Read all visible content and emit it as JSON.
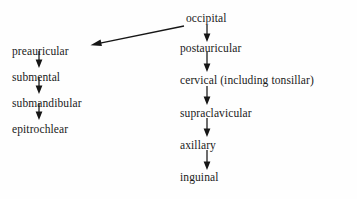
{
  "diagram": {
    "background_color": "#fefefe",
    "text_color": "#1a1a1a",
    "arrow_color": "#161616",
    "columns": [
      {
        "name": "left-column",
        "nodes": [
          {
            "id": "preauricular",
            "label": "preauricular",
            "x": 12,
            "y": 46
          },
          {
            "id": "submental",
            "label": "submental",
            "x": 12,
            "y": 72
          },
          {
            "id": "submandibular",
            "label": "submandibular",
            "x": 12,
            "y": 98
          },
          {
            "id": "epitrochlear",
            "label": "epitrochlear",
            "x": 12,
            "y": 124
          }
        ]
      },
      {
        "name": "right-column",
        "nodes": [
          {
            "id": "occipital",
            "label": "occipital",
            "x": 186,
            "y": 20
          },
          {
            "id": "postauricular",
            "label": "postauricular",
            "x": 180,
            "y": 46
          },
          {
            "id": "cervical-including-tonsillar",
            "label": "cervical (including tonsillar)",
            "x": 180,
            "y": 80
          },
          {
            "id": "supraclavicular",
            "label": "supraclavicular",
            "x": 180,
            "y": 112
          },
          {
            "id": "axillary",
            "label": "axillary",
            "x": 180,
            "y": 144
          },
          {
            "id": "inguinal",
            "label": "inguinal",
            "x": 180,
            "y": 177
          }
        ]
      }
    ],
    "edges": [
      {
        "id": "edge-preauricular-submental",
        "from": "preauricular",
        "to": "submental",
        "kind": "vertical",
        "x": 39,
        "y1": 51,
        "y2": 67
      },
      {
        "id": "edge-submental-submandibular",
        "from": "submental",
        "to": "submandibular",
        "kind": "vertical",
        "x": 39,
        "y1": 77,
        "y2": 93
      },
      {
        "id": "edge-submandibular-epitrochlear",
        "from": "submandibular",
        "to": "epitrochlear",
        "kind": "vertical",
        "x": 39,
        "y1": 103,
        "y2": 119
      },
      {
        "id": "edge-occipital-postauricular",
        "from": "occipital",
        "to": "postauricular",
        "kind": "vertical",
        "x": 207,
        "y1": 25,
        "y2": 41
      },
      {
        "id": "edge-postauricular-cervical",
        "from": "postauricular",
        "to": "cervical-including-tonsillar",
        "kind": "vertical",
        "x": 207,
        "y1": 52,
        "y2": 72
      },
      {
        "id": "edge-cervical-supraclavicular",
        "from": "cervical-including-tonsillar",
        "to": "supraclavicular",
        "kind": "vertical",
        "x": 207,
        "y1": 86,
        "y2": 105
      },
      {
        "id": "edge-supraclavicular-axillary",
        "from": "supraclavicular",
        "to": "axillary",
        "kind": "vertical",
        "x": 207,
        "y1": 118,
        "y2": 137
      },
      {
        "id": "edge-axillary-inguinal",
        "from": "axillary",
        "to": "inguinal",
        "kind": "vertical",
        "x": 207,
        "y1": 150,
        "y2": 170
      },
      {
        "id": "edge-occipital-preauricular",
        "from": "occipital",
        "to": "preauricular",
        "kind": "diagonal",
        "x1": 184,
        "y1": 26,
        "x2": 91,
        "y2": 45
      }
    ]
  }
}
